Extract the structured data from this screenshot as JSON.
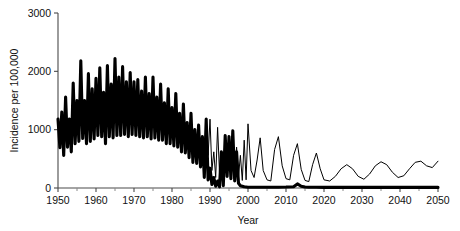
{
  "chart_data": {
    "type": "line",
    "title": "",
    "xlabel": "Year",
    "ylabel": "Incidence per 100,000",
    "xlim": [
      1950,
      2050
    ],
    "ylim": [
      0,
      3000
    ],
    "grid": false,
    "legend": "none",
    "x_ticks": [
      1950,
      1960,
      1970,
      1980,
      1990,
      2000,
      2010,
      2020,
      2030,
      2040,
      2050
    ],
    "x_minor_tick_step": 5,
    "y_ticks": [
      0,
      1000,
      2000,
      3000
    ],
    "x_tick_labels": [
      "1950",
      "1960",
      "1970",
      "1980",
      "1990",
      "2000",
      "2010",
      "2020",
      "2030",
      "2040",
      "2050"
    ],
    "y_tick_labels": [
      "0",
      "1000",
      "2000",
      "3000"
    ],
    "series": [
      {
        "name": "observed-incidence",
        "style": "thick-solid",
        "color": "#000000",
        "linewidth": 3.1,
        "x": [
          1950,
          1950.5,
          1951,
          1951.5,
          1952,
          1952.5,
          1953,
          1953.5,
          1954,
          1954.5,
          1955,
          1955.5,
          1956,
          1956.5,
          1957,
          1957.5,
          1958,
          1958.5,
          1959,
          1959.5,
          1960,
          1960.5,
          1961,
          1961.5,
          1962,
          1962.5,
          1963,
          1963.5,
          1964,
          1964.5,
          1965,
          1965.5,
          1966,
          1966.5,
          1967,
          1967.5,
          1968,
          1968.5,
          1969,
          1969.5,
          1970,
          1970.5,
          1971,
          1971.5,
          1972,
          1972.5,
          1973,
          1973.5,
          1974,
          1974.5,
          1975,
          1975.5,
          1976,
          1976.5,
          1977,
          1977.5,
          1978,
          1978.5,
          1979,
          1979.5,
          1980,
          1980.5,
          1981,
          1981.5,
          1982,
          1982.5,
          1983,
          1983.5,
          1984,
          1984.5,
          1985,
          1985.5,
          1986,
          1986.5,
          1987,
          1987.5,
          1988,
          1988.5,
          1989,
          1989.5,
          1990,
          1990.5,
          1991,
          1991.5,
          1992,
          1992.5,
          1993,
          1993.5,
          1994,
          1994.5,
          1995,
          1995.5,
          1996,
          1996.5,
          1997,
          1997.5,
          1998,
          1999,
          2000,
          2002,
          2005,
          2008,
          2010,
          2012,
          2013,
          2014,
          2015,
          2016,
          2018,
          2020,
          2025,
          2030,
          2035,
          2040,
          2045,
          2050
        ],
        "y": [
          1180,
          690,
          1300,
          560,
          1560,
          700,
          1180,
          620,
          1800,
          760,
          1500,
          800,
          2180,
          850,
          1500,
          760,
          1960,
          800,
          1700,
          840,
          1880,
          900,
          2060,
          880,
          1640,
          760,
          2100,
          880,
          1780,
          860,
          2220,
          900,
          1900,
          900,
          2080,
          920,
          1820,
          880,
          1980,
          920,
          1820,
          900,
          1860,
          880,
          1660,
          860,
          1900,
          880,
          1620,
          840,
          1900,
          860,
          1560,
          820,
          1780,
          820,
          1460,
          760,
          1700,
          760,
          1380,
          720,
          1620,
          700,
          1280,
          620,
          1440,
          600,
          1120,
          520,
          1280,
          440,
          1000,
          420,
          1080,
          360,
          880,
          180,
          1180,
          140,
          340,
          60,
          180,
          30,
          120,
          20,
          620,
          40,
          900,
          200,
          880,
          160,
          980,
          120,
          620,
          80,
          40,
          20,
          14,
          12,
          12,
          14,
          16,
          22,
          70,
          30,
          16,
          14,
          12,
          10,
          10,
          10,
          10,
          10,
          10,
          10
        ],
        "note": "Observed/post-vaccination incidence; biennial epidemic peaks 1950-1990 then collapse to near zero after 2000"
      },
      {
        "name": "counterfactual-projection",
        "style": "thin-solid",
        "color": "#000000",
        "linewidth": 1.0,
        "x": [
          1989,
          1989.5,
          1990,
          1990.5,
          1991,
          1991.5,
          1992,
          1992.5,
          1993,
          1993.5,
          1994,
          1994.5,
          1995,
          1995.5,
          1996,
          1996.5,
          1997,
          1997.5,
          1998,
          1998.5,
          1999,
          1999.5,
          2000,
          2000.8,
          2001.6,
          2002.4,
          2003.2,
          2004,
          2005,
          2006,
          2007,
          2008,
          2009,
          2010,
          2011,
          2012,
          2013,
          2014,
          2015,
          2016,
          2017,
          2018,
          2019,
          2020,
          2021.5,
          2023,
          2024.5,
          2026,
          2027.5,
          2029,
          2030.5,
          2032,
          2033.5,
          2035,
          2036.5,
          2038,
          2039.5,
          2041,
          2042.5,
          2044,
          2045.5,
          2047,
          2048.5,
          2050
        ],
        "y": [
          1180,
          560,
          1180,
          300,
          620,
          180,
          1040,
          260,
          620,
          220,
          900,
          240,
          780,
          300,
          980,
          320,
          700,
          200,
          560,
          130,
          820,
          140,
          1100,
          300,
          180,
          480,
          860,
          300,
          140,
          120,
          660,
          880,
          380,
          160,
          140,
          560,
          760,
          320,
          130,
          110,
          400,
          600,
          330,
          140,
          120,
          200,
          330,
          400,
          330,
          200,
          150,
          240,
          380,
          450,
          400,
          270,
          180,
          210,
          330,
          440,
          460,
          380,
          350,
          460
        ],
        "note": "Projected incidence without sustained control; damped oscillation decaying then re-emerging toward 2050"
      }
    ]
  },
  "axes": {
    "y_axis_title": "Incidence per 100,000",
    "x_axis_title": "Year"
  },
  "colors": {
    "axis": "#4a4a4a",
    "line": "#000000",
    "background": "#ffffff"
  }
}
